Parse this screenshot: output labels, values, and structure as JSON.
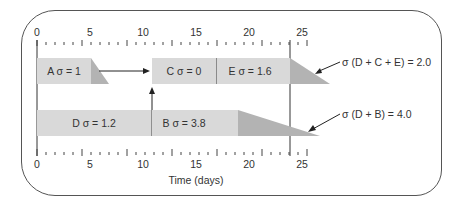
{
  "diagram": {
    "type": "schedule-timeline",
    "axis": {
      "label": "Time (days)",
      "min": 0,
      "max": 30,
      "major_ticks": [
        "0",
        "5",
        "10",
        "15",
        "20",
        "25",
        "30"
      ]
    },
    "rows": [
      {
        "name": "top-path",
        "activities": [
          {
            "label": "A  σ = 1"
          },
          {
            "label": "C  σ = 0"
          },
          {
            "label": "E  σ = 1.6"
          }
        ],
        "annotation": "σ (D + C + E) = 2.0"
      },
      {
        "name": "bottom-path",
        "activities": [
          {
            "label": "D  σ = 1.2"
          },
          {
            "label": "B  σ = 3.8"
          }
        ],
        "annotation": "σ (D + B) = 4.0"
      }
    ],
    "colors": {
      "bar": "#d9d9d9",
      "variance": "#b3b3b3",
      "line": "#333333"
    }
  }
}
